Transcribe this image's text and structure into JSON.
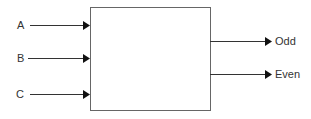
{
  "diagram": {
    "block": {
      "x": 90,
      "y": 7,
      "width": 120,
      "height": 103
    },
    "inputs": [
      {
        "label": "A",
        "y": 25
      },
      {
        "label": "B",
        "y": 58
      },
      {
        "label": "C",
        "y": 94
      }
    ],
    "outputs": [
      {
        "label": "Odd",
        "y": 41
      },
      {
        "label": "Even",
        "y": 74
      }
    ],
    "colors": {
      "line": "#333333",
      "box": "#555555",
      "text": "#333333"
    }
  }
}
